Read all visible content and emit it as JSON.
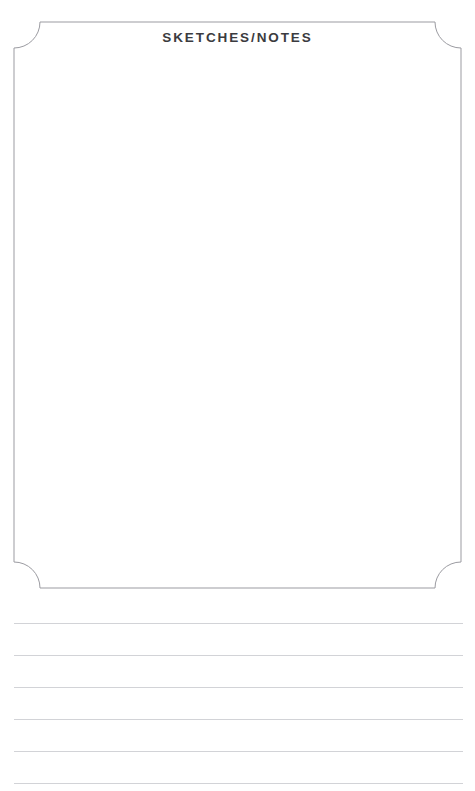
{
  "page": {
    "name": "sketches-notes-page",
    "background_color": "#ffffff",
    "width": 475,
    "height": 791
  },
  "sketch_box": {
    "title": "SKETCHES/NOTES",
    "border_color": "#9b9ba1",
    "fill_color": "#ffffff",
    "corner_style": "concave-notched",
    "corner_radius": 26,
    "bounds": {
      "left": 14,
      "top": 22,
      "right": 461,
      "bottom": 588
    },
    "content_placeholder": ""
  },
  "ruled_lines": {
    "color": "#d2d3d7",
    "left": 14,
    "right": 463,
    "spacing": 32,
    "count": 6,
    "y_positions": [
      623,
      655,
      687,
      719,
      751,
      783
    ],
    "values": [
      "",
      "",
      "",
      "",
      "",
      ""
    ]
  }
}
